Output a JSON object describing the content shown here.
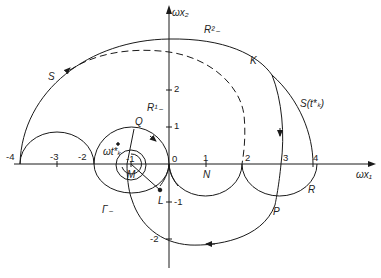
{
  "axes": {
    "x_label": "ωx₁",
    "y_label": "ωx₂",
    "x_ticks": [
      "-4",
      "-3",
      "-2",
      "-1",
      "0",
      "1",
      "2",
      "3",
      "4"
    ],
    "y_ticks": [
      "2",
      "1",
      "-1",
      "-2"
    ]
  },
  "labels": {
    "S": "S",
    "R2": "R²₋",
    "R1": "R¹₋",
    "K": "K",
    "S_t": "S(t*ₖ)",
    "Q": "Q",
    "omega_t": "ωt*ₖ",
    "M": "M",
    "L": "L",
    "Gamma": "Γ₋",
    "N": "N",
    "P": "P",
    "R": "R"
  },
  "colors": {
    "line": "#1a1a1a",
    "background": "#ffffff"
  }
}
